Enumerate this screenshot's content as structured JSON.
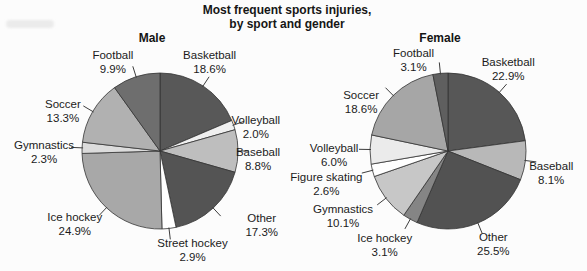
{
  "title": {
    "line1": "Most frequent sports injuries,",
    "line2": "by sport and gender"
  },
  "style": {
    "background": "#fcfcfc",
    "slice_stroke": "#333333",
    "leader_color": "#3d3d3d",
    "text_color": "#1b1b1b"
  },
  "chart_data": [
    {
      "type": "pie",
      "title": "Male",
      "start_angle_deg": 0,
      "direction": "clockwise",
      "legend": "none",
      "layout": {
        "cx": 160,
        "cy": 151,
        "r": 78,
        "label_rx": 108,
        "label_ry": 104,
        "title_x": 152,
        "title_y": 42
      },
      "slices": [
        {
          "label": "Basketball",
          "value": 18.6,
          "display": "18.6%",
          "color": "#585858",
          "nudge": [
            -10,
            -3
          ]
        },
        {
          "label": "Volleyball",
          "value": 2.0,
          "display": "2.0%",
          "color": "#f0f0f0",
          "nudge": [
            -6,
            10
          ]
        },
        {
          "label": "Baseball",
          "value": 8.8,
          "display": "8.8%",
          "color": "#bebebe",
          "nudge": [
            -10,
            7
          ]
        },
        {
          "label": "Other",
          "value": 17.3,
          "display": "17.3%",
          "color": "#545454",
          "nudge": [
            28,
            -3
          ]
        },
        {
          "label": "Street hockey",
          "value": 2.9,
          "display": "2.9%",
          "color": "#ffffff",
          "nudge": [
            20,
            -5
          ]
        },
        {
          "label": "Ice hockey",
          "value": 24.9,
          "display": "24.9%",
          "color": "#a8a8a8",
          "nudge": [
            -11,
            -4
          ]
        },
        {
          "label": "Gymnastics",
          "value": 2.3,
          "display": "2.3%",
          "color": "#dcdcdc",
          "nudge": [
            -8,
            4
          ]
        },
        {
          "label": "Soccer",
          "value": 13.3,
          "display": "13.3%",
          "color": "#b1b1b1",
          "nudge": [
            -4,
            12
          ]
        },
        {
          "label": "Football",
          "value": 9.9,
          "display": "9.9%",
          "color": "#6e6e6e",
          "nudge": [
            -14,
            9
          ]
        }
      ]
    },
    {
      "type": "pie",
      "title": "Female",
      "start_angle_deg": 0,
      "direction": "clockwise",
      "legend": "none",
      "layout": {
        "cx": 448,
        "cy": 151,
        "r": 78,
        "label_rx": 108,
        "label_ry": 104,
        "title_x": 440,
        "title_y": 42
      },
      "slices": [
        {
          "label": "Basketball",
          "value": 22.9,
          "display": "22.9%",
          "color": "#575757",
          "nudge": [
            -11,
            -5
          ]
        },
        {
          "label": "Baseball",
          "value": 8.1,
          "display": "8.1%",
          "color": "#b8b8b8",
          "nudge": [
            -4,
            8
          ]
        },
        {
          "label": "Other",
          "value": 25.5,
          "display": "25.5%",
          "color": "#525252",
          "nudge": [
            4,
            -4
          ]
        },
        {
          "label": "Ice hockey",
          "value": 3.1,
          "display": "3.1%",
          "color": "#858585",
          "nudge": [
            -11,
            2
          ]
        },
        {
          "label": "Gymnastics",
          "value": 10.1,
          "display": "10.1%",
          "color": "#c7c7c7",
          "nudge": [
            -19,
            1
          ]
        },
        {
          "label": "Figure skating",
          "value": 2.6,
          "display": "2.6%",
          "color": "#ffffff",
          "nudge": [
            -17,
            6
          ]
        },
        {
          "label": "Volleyball",
          "value": 6.0,
          "display": "6.0%",
          "color": "#ebebeb",
          "nudge": [
            -6,
            5
          ]
        },
        {
          "label": "Soccer",
          "value": 18.6,
          "display": "18.6%",
          "color": "#a6a6a6",
          "nudge": [
            -11,
            24
          ]
        },
        {
          "label": "Football",
          "value": 3.1,
          "display": "3.1%",
          "color": "#5f5f5f",
          "nudge": [
            -24,
            11
          ]
        }
      ]
    }
  ]
}
